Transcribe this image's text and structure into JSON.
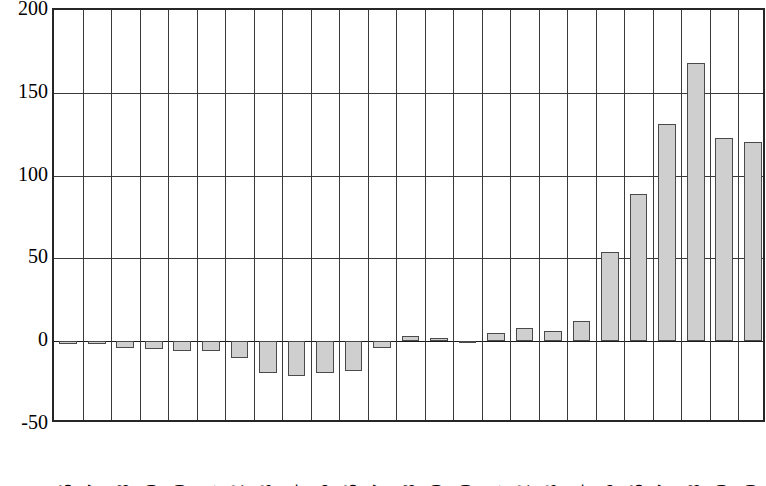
{
  "chart_data": {
    "type": "bar",
    "title": "",
    "subtitle": "",
    "xlabel": "",
    "ylabel": "",
    "categories": [
      "1986",
      "1987",
      "1988",
      "1989",
      "1990",
      "1991",
      "1992",
      "1993",
      "1994",
      "1995",
      "1996",
      "1997",
      "1998",
      "1999",
      "2000",
      "2001",
      "2002",
      "2003",
      "2004",
      "2005",
      "2006",
      "2007",
      "2008",
      "2009",
      "2010"
    ],
    "values": [
      -2,
      -2,
      -4,
      -5,
      -6,
      -6,
      -10,
      -19,
      -21,
      -19,
      -18,
      -4,
      3,
      2,
      -1,
      5,
      8,
      6,
      12,
      54,
      89,
      131,
      168,
      123,
      120
    ],
    "series": [
      {
        "name": "",
        "values": [
          -2,
          -2,
          -4,
          -5,
          -6,
          -6,
          -10,
          -19,
          -21,
          -19,
          -18,
          -4,
          3,
          2,
          -1,
          5,
          8,
          6,
          12,
          54,
          89,
          131,
          168,
          123,
          120
        ]
      }
    ],
    "ylim": [
      -50,
      200
    ],
    "yticks": [
      200,
      150,
      100,
      50,
      0,
      -50
    ],
    "ytick_labels": [
      "200",
      "150",
      "100",
      "50",
      "0",
      "-50"
    ],
    "grid": {
      "horizontal": true,
      "vertical": true
    },
    "legend": {
      "visible": false,
      "position": "none",
      "entries": []
    },
    "annotations": [],
    "colors": {
      "bar_fill": "#cfcfcf",
      "bar_stroke": "#4a4a4a",
      "grid": "#3a3a3a",
      "axis": "#262626",
      "text": "#000000",
      "background": "#ffffff"
    }
  }
}
